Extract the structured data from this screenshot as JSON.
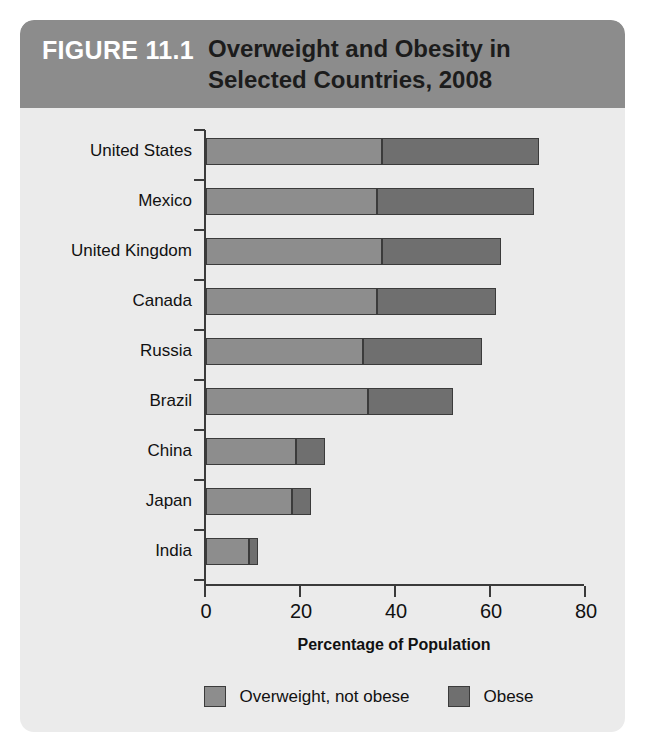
{
  "figure": {
    "number_label": "FIGURE 11.1",
    "title_line_1": "Overweight and Obesity in",
    "title_line_2": "Selected Countries, 2008",
    "header_color": "#8c8c8c",
    "body_color": "#ebebeb"
  },
  "chart_data": {
    "type": "bar",
    "orientation": "horizontal",
    "stacked": true,
    "title": "Overweight and Obesity in Selected Countries, 2008",
    "xlabel": "Percentage of Population",
    "ylabel": "",
    "xlim": [
      0,
      80
    ],
    "xticks": [
      0,
      20,
      40,
      60,
      80
    ],
    "xtick_labels": [
      "0",
      "20",
      "40",
      "60",
      "80"
    ],
    "grid": false,
    "legend_position": "bottom",
    "categories": [
      "United States",
      "Mexico",
      "United Kingdom",
      "Canada",
      "Russia",
      "Brazil",
      "China",
      "Japan",
      "India"
    ],
    "series": [
      {
        "name": "Overweight, not obese",
        "color": "#8d8d8d",
        "values": [
          37,
          36,
          37,
          36,
          33,
          34,
          19,
          18,
          9
        ]
      },
      {
        "name": "Obese",
        "color": "#6f6f6f",
        "values": [
          33,
          33,
          25,
          25,
          25,
          18,
          6,
          4,
          2
        ]
      }
    ],
    "totals": [
      70,
      69,
      62,
      61,
      58,
      52,
      25,
      22,
      11
    ]
  },
  "axis": {
    "x_title": "Percentage of Population"
  },
  "legend": {
    "items": [
      {
        "label": "Overweight, not obese",
        "color": "#8d8d8d"
      },
      {
        "label": "Obese",
        "color": "#6f6f6f"
      }
    ]
  }
}
